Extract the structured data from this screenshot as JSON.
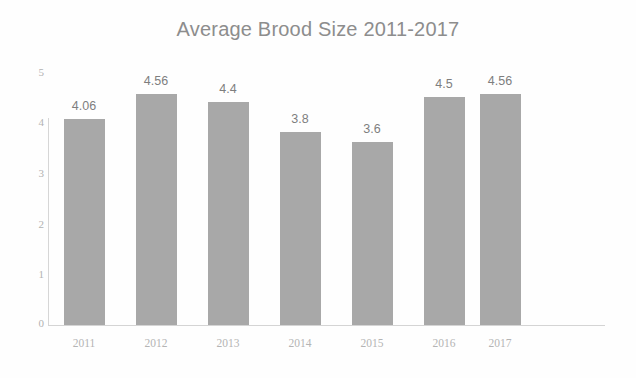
{
  "chart_data": {
    "type": "bar",
    "title": "Average Brood Size 2011-2017",
    "xlabel": "",
    "ylabel": "",
    "categories": [
      "2011",
      "2012",
      "2013",
      "2014",
      "2015",
      "2016",
      "2017"
    ],
    "values": [
      4.06,
      4.56,
      4.4,
      3.8,
      3.6,
      4.5,
      4.56
    ],
    "data_labels": [
      "4.06",
      "4.56",
      "4.4",
      "3.8",
      "3.6",
      "4.5",
      "4.56"
    ],
    "ylim": [
      0,
      5
    ],
    "ytick_labels": [
      "0",
      "1",
      "2",
      "3",
      "4",
      "5"
    ],
    "ytick_values": [
      0,
      1,
      2,
      3,
      4,
      5
    ],
    "grid": false,
    "legend": null,
    "legend_position": "none",
    "series": [
      {
        "name": "Average Brood Size",
        "values": [
          4.06,
          4.56,
          4.4,
          3.8,
          3.6,
          4.5,
          4.56
        ]
      }
    ],
    "colors": {
      "bar_fill": "#a8a8a8",
      "background": "#fefefe",
      "title_text": "#8d8d8d",
      "tick_text": "#b2b2b2",
      "category_text": "#b4b4b4",
      "value_label_text": "#7e7e7e",
      "axis_line": "#d6d6d6"
    }
  }
}
